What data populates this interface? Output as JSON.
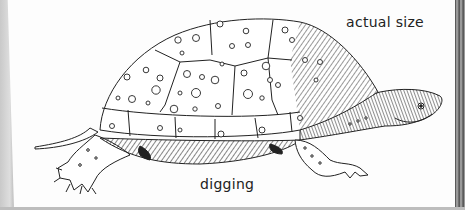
{
  "illustration": {
    "subject": "spotted turtle pen-and-ink drawing",
    "labels": {
      "size_note": "actual size",
      "caption": "digging"
    },
    "colors": {
      "ink": "#222222",
      "paper": "#fdfdfd",
      "edge": "#c9c9c9"
    }
  }
}
